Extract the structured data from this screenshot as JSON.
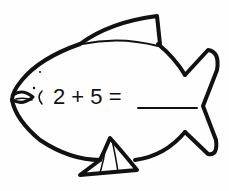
{
  "worksheet": {
    "equation": "2 + 5 =",
    "answer": "",
    "figure": "fish-outline"
  },
  "colors": {
    "stroke": "#111111",
    "background": "#fefefe"
  }
}
